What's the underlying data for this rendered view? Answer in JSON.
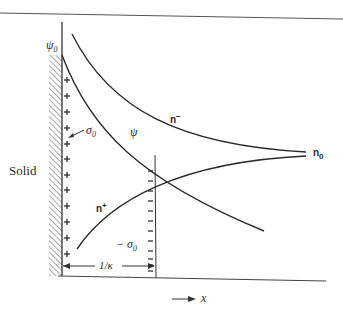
{
  "diagram": {
    "type": "electrical double layer",
    "labels": {
      "solid": "Solid",
      "psi0_symbol": "ψ",
      "psi0_sub": "0",
      "psi": "ψ",
      "sigma0_symbol": "σ",
      "sigma0_sub": "0",
      "neg_sigma0_prefix": "−",
      "neg_sigma0_symbol": "σ",
      "neg_sigma0_sub": "0",
      "n_minus_base": "n",
      "n_minus_sup": "−",
      "n_plus_base": "n",
      "n_plus_sup": "+",
      "n0_base": "n",
      "n0_sub": "0",
      "debye_length": "1/κ",
      "x_axis": "x"
    },
    "curves": [
      {
        "name": "psi",
        "description": "potential decaying from ψ0 at wall"
      },
      {
        "name": "n-minus",
        "description": "anion concentration rising toward n0"
      },
      {
        "name": "n-plus",
        "description": "cation concentration decaying toward n0"
      }
    ],
    "charges": {
      "surface": "+",
      "diffuse": "−",
      "plus_count": 12,
      "minus_count": 12
    },
    "colors": {
      "ink": "#2a2a2a",
      "background": "#ffffff"
    }
  }
}
